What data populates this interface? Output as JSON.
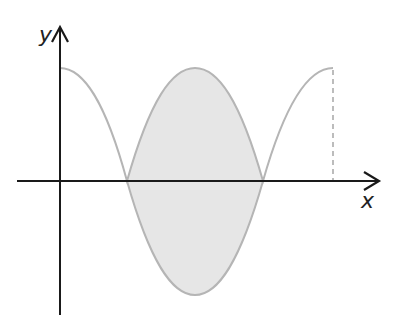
{
  "diagram": {
    "type": "function-graph",
    "axes": {
      "x_label": "x",
      "y_label": "y"
    },
    "curves": [
      {
        "name": "upper-curve",
        "equation": "y = |cos x|",
        "domain": "[0, 2π]",
        "color": "#b5b5b5"
      },
      {
        "name": "lower-curve",
        "equation": "y = -|cos x|",
        "domain": "[π/2, 3π/2]",
        "color": "#b5b5b5"
      }
    ],
    "shaded_region": {
      "from": "π/2",
      "to": "3π/2",
      "fill": "#e6e6e6"
    },
    "dashed_line": {
      "at": "x = 2π",
      "color": "#999999"
    },
    "colors": {
      "axis": "#1a1a1a",
      "curve": "#b5b5b5",
      "fill": "#e6e6e6",
      "background": "#ffffff"
    }
  }
}
